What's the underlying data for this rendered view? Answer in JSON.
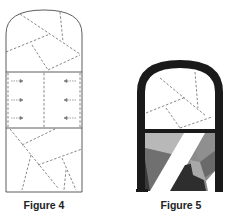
{
  "figures": [
    {
      "caption": "Figure 4",
      "description": "Arched window pattern outline with dashed cut lines and arrows",
      "colors": {
        "outline": "#333333",
        "dash": "#555555"
      }
    },
    {
      "caption": "Figure 5",
      "description": "Arched stained-glass window with thick black frame and grey shaded panes",
      "colors": {
        "frame": "#1a1a1a",
        "light_grey": "#b8b8b8",
        "mid_grey": "#8a8a8a",
        "dark_grey": "#6a6a6a",
        "darkest": "#2e2e2e",
        "white": "#ffffff"
      }
    }
  ]
}
